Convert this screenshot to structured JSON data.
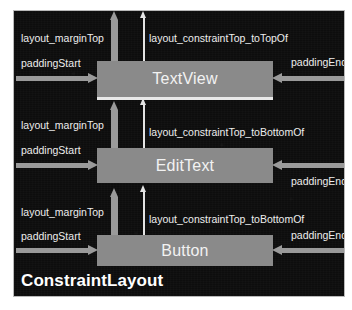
{
  "diagram": {
    "container_label": "ConstraintLayout",
    "widgets": [
      {
        "name": "TextView",
        "margin_top_label": "layout_marginTop",
        "constraint_label": "layout_constraintTop_toTopOf",
        "padding_start_label": "paddingStart",
        "padding_end_label": "paddingEnd"
      },
      {
        "name": "EditText",
        "margin_top_label": "layout_marginTop",
        "constraint_label": "layout_constraintTop_toBottomOf",
        "padding_start_label": "paddingStart",
        "padding_end_label": "paddingEnd"
      },
      {
        "name": "Button",
        "margin_top_label": "layout_marginTop",
        "constraint_label": "layout_constraintTop_toBottomOf",
        "padding_start_label": "paddingStart",
        "padding_end_label": "paddingEnd"
      }
    ],
    "colors": {
      "panel_background": "#0d0d0d",
      "panel_border": "#b9b9b9",
      "widget_fill": "#8a8a8a",
      "margin_arrow": "#9a9a9a",
      "constraint_arrow": "#e4e4e4",
      "label_text": "#ededed",
      "widget_text": "#f2f2f2",
      "title_text": "#ffffff"
    }
  }
}
